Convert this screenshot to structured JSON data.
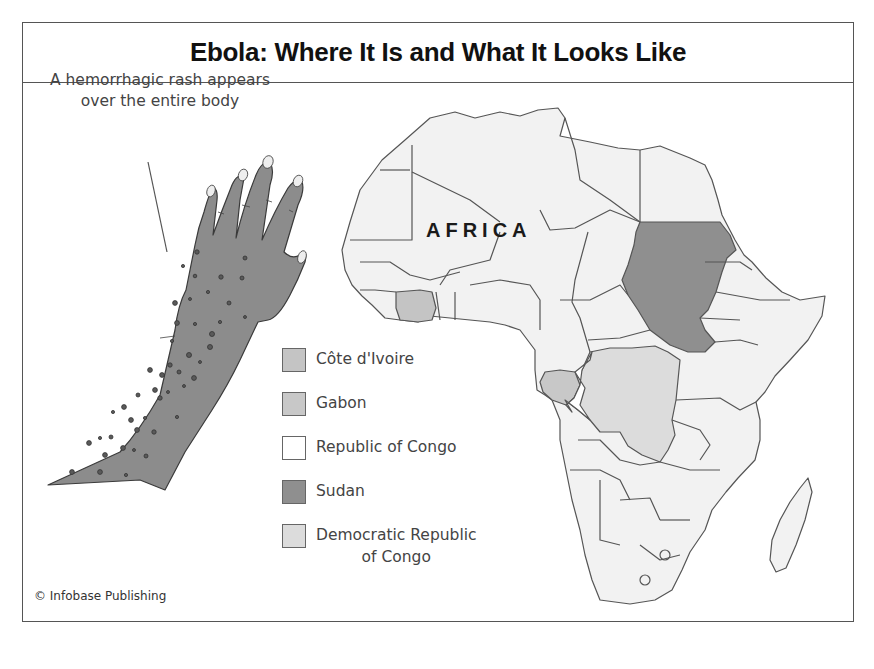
{
  "title": "Ebola: Where It Is and What It Looks Like",
  "illustration": {
    "caption_line1": "A hemorrhagic rash appears",
    "caption_line2": "over the entire body",
    "subject": "rash-covered hand and forearm",
    "skin_color": "#8c8c8c",
    "spot_color": "#5a5a5a"
  },
  "map": {
    "region_label": "AFRICA",
    "base_color": "#f2f2f2",
    "border_color": "#555555"
  },
  "legend": {
    "items": [
      {
        "label": "Côte d'Ivoire",
        "color": "#c4c4c4"
      },
      {
        "label": "Gabon",
        "color": "#c8c8c8"
      },
      {
        "label": "Republic of Congo",
        "color": "#ffffff"
      },
      {
        "label": "Sudan",
        "color": "#8f8f8f"
      },
      {
        "label_line1": "Democratic Republic",
        "label_line2": "of Congo",
        "color": "#dcdcdc"
      }
    ]
  },
  "credit": "© Infobase Publishing"
}
